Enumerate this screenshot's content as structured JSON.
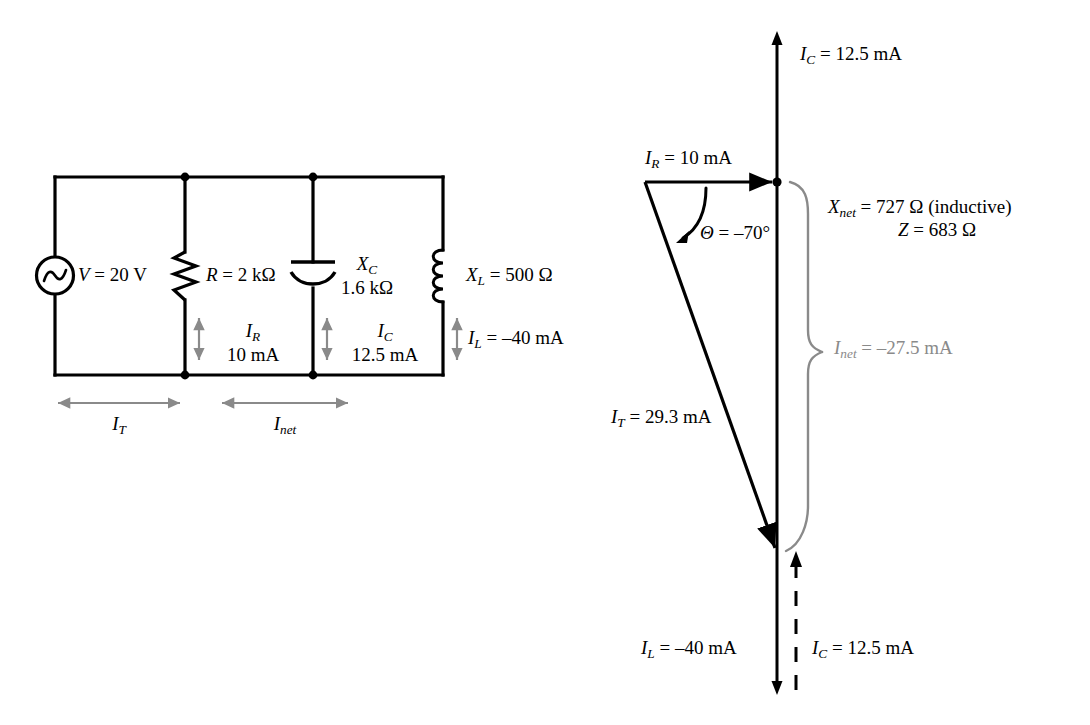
{
  "figure": {
    "type": "circuit-and-phasor-diagram"
  },
  "colors": {
    "wire": "#000000",
    "text": "#000000",
    "current_arrow": "#8a8a8a",
    "brace": "#8a8a8a",
    "inet_label": "#8a8a8a"
  },
  "circuit": {
    "source": {
      "icon": "ac-source-icon",
      "label_var": "V",
      "label_eq": " = 20 V",
      "value": "20 V"
    },
    "resistor": {
      "icon": "resistor-icon",
      "label_var": "R",
      "label_eq": " = 2 kΩ",
      "value": "2 kΩ",
      "current_var": "I",
      "current_sub": "R",
      "current_value": "10 mA"
    },
    "capacitor": {
      "icon": "capacitor-icon",
      "label_var": "X",
      "label_sub": "C",
      "value_line": "1.6 kΩ",
      "current_var": "I",
      "current_sub": "C",
      "current_value": "12.5 mA"
    },
    "inductor": {
      "icon": "inductor-icon",
      "label_var": "X",
      "label_sub": "L",
      "label_eq": " = 500  Ω",
      "value": "500 Ω",
      "current_var": "I",
      "current_sub": "L",
      "current_eq": " = –40 mA",
      "current_value": "–40 mA"
    },
    "span_total": {
      "var": "I",
      "sub": "T"
    },
    "span_net": {
      "var": "I",
      "sub": "net"
    }
  },
  "phasor": {
    "axis_top": {
      "var": "I",
      "sub": "C",
      "eq": " = 12.5 mA",
      "value": "12.5 mA"
    },
    "ir": {
      "var": "I",
      "sub": "R",
      "eq": " = 10 mA",
      "value": "10 mA"
    },
    "theta": {
      "symbol": "Θ",
      "eq": " = –70°",
      "value": "–70°"
    },
    "it": {
      "var": "I",
      "sub": "T",
      "eq": " = 29.3 mA",
      "value": "29.3 mA"
    },
    "xnet": {
      "var": "X",
      "sub": "net",
      "eq": " = 727 Ω (inductive)",
      "value": "727 Ω",
      "note": "(inductive)"
    },
    "z": {
      "var": "Z",
      "eq": " = 683 Ω",
      "value": "683 Ω"
    },
    "inet": {
      "var": "I",
      "sub": "net",
      "eq": " = –27.5 mA",
      "value": "–27.5 mA"
    },
    "il_bottom": {
      "var": "I",
      "sub": "L",
      "eq": " = –40 mA",
      "value": "–40 mA"
    },
    "ic_bottom": {
      "var": "I",
      "sub": "C",
      "eq": " = 12.5 mA",
      "value": "12.5 mA"
    }
  }
}
